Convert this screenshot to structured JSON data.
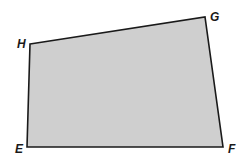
{
  "diagram": {
    "type": "quadrilateral",
    "fill": "#cfcfcf",
    "stroke": "#1a1a1a",
    "vertices": [
      {
        "label": "H",
        "x": 30,
        "y": 44,
        "lx": 17,
        "ly": 48
      },
      {
        "label": "G",
        "x": 205,
        "y": 17,
        "lx": 210,
        "ly": 21
      },
      {
        "label": "F",
        "x": 223,
        "y": 147,
        "lx": 228,
        "ly": 153
      },
      {
        "label": "E",
        "x": 27,
        "y": 147,
        "lx": 15,
        "ly": 153
      }
    ]
  }
}
